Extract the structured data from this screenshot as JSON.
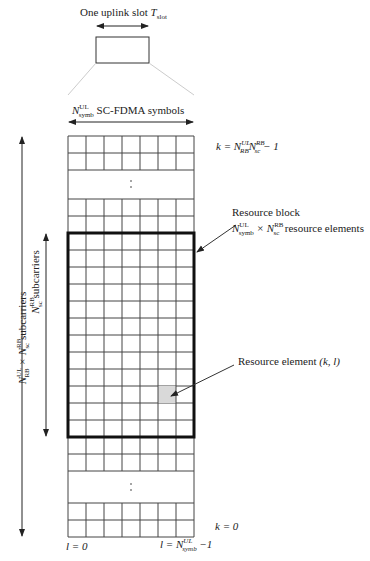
{
  "top": {
    "slot_label": "One uplink slot",
    "slot_symbol": "T",
    "slot_sub": "slot"
  },
  "symbols_label": {
    "N": "N",
    "sup": "UL",
    "sub": "symb",
    "text": "SC-FDMA symbols"
  },
  "k_top": {
    "prefix": "k = N",
    "sup1": "UL",
    "sub1": "RB",
    "mid": "N",
    "sup2": "RB",
    "sub2": "sc",
    "suffix": " − 1"
  },
  "k_bottom": "k = 0",
  "l_left": "l = 0",
  "l_right": {
    "prefix": "l = N",
    "sup": "UL",
    "sub": "symb",
    "suffix": " −1"
  },
  "resource_block": {
    "title": "Resource block",
    "N1": "N",
    "sup1": "UL",
    "sub1": "symb",
    "times": " × N",
    "sup2": "RB",
    "sub2": "sc",
    "text": "resource elements"
  },
  "resource_element": {
    "label": "Resource element",
    "coords": "(k, l)"
  },
  "left_outer": {
    "N": "N",
    "sup1": "UL",
    "sub1": "RB",
    "times": " × N",
    "sup2": "RB",
    "sub2": "sc",
    "text": " subcarriers"
  },
  "left_inner": {
    "N": "N",
    "sup": "RB",
    "sub": "sc",
    "text": " subcarriers"
  },
  "grid": {
    "columns": 7,
    "block_rows": 12,
    "highlight_color": "#d9d9d9"
  }
}
